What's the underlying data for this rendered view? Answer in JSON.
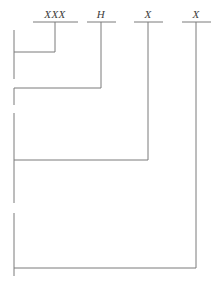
{
  "figure": {
    "kind": "bracket-tree-diagram",
    "width": 212,
    "height": 282,
    "background_color": "#ffffff",
    "line_color": "#7a7a7a",
    "text_color": "#3b3b3b",
    "line_width": 1
  },
  "columns": [
    {
      "id": "col-1",
      "label": "XXX",
      "x": 55,
      "underline": {
        "x1": 33,
        "x2": 78,
        "y": 22
      },
      "drop_line": {
        "x": 55,
        "y1": 22,
        "y2": 52
      }
    },
    {
      "id": "col-2",
      "label": "H",
      "x": 101,
      "underline": {
        "x1": 87,
        "x2": 116,
        "y": 22
      },
      "drop_line": {
        "x": 101,
        "y1": 22,
        "y2": 88
      }
    },
    {
      "id": "col-3",
      "label": "X",
      "x": 148,
      "underline": {
        "x1": 134,
        "x2": 163,
        "y": 22
      },
      "drop_line": {
        "x": 148,
        "y1": 22,
        "y2": 160
      }
    },
    {
      "id": "col-4",
      "label": "X",
      "x": 196,
      "underline": {
        "x1": 182,
        "x2": 211,
        "y": 22
      },
      "drop_line": {
        "x": 196,
        "y1": 22,
        "y2": 268
      }
    }
  ],
  "spine": {
    "x": 14,
    "segments": [
      {
        "id": "spine-seg-1",
        "y1": 30,
        "y2": 79
      },
      {
        "id": "spine-seg-2",
        "y1": 88,
        "y2": 105
      },
      {
        "id": "spine-seg-3",
        "y1": 113,
        "y2": 203
      },
      {
        "id": "spine-seg-4",
        "y1": 213,
        "y2": 276
      }
    ]
  },
  "connectors": [
    {
      "id": "connector-1",
      "x1": 14,
      "x2": 55,
      "y": 52
    },
    {
      "id": "connector-2",
      "x1": 14,
      "x2": 101,
      "y": 88
    },
    {
      "id": "connector-3",
      "x1": 14,
      "x2": 148,
      "y": 160
    },
    {
      "id": "connector-4",
      "x1": 14,
      "x2": 196,
      "y": 268
    }
  ]
}
